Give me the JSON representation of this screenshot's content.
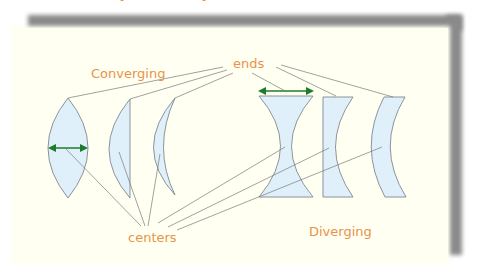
{
  "diagram": {
    "title_partial": "Converging and Diverging Lenses",
    "labels": {
      "converging": "Converging",
      "diverging": "Diverging",
      "ends": "ends",
      "centers": "centers"
    },
    "colors": {
      "label": "#e8934a",
      "lens_fill": "#dff0fa",
      "lens_stroke": "#808890",
      "arrow": "#1e7a2e",
      "panel": "#fffff2",
      "shadow": "#8a8a8a"
    },
    "lenses": [
      {
        "name": "biconvex",
        "group": "converging"
      },
      {
        "name": "plano-convex",
        "group": "converging"
      },
      {
        "name": "positive-meniscus",
        "group": "converging"
      },
      {
        "name": "biconcave",
        "group": "diverging"
      },
      {
        "name": "plano-concave",
        "group": "diverging"
      },
      {
        "name": "negative-meniscus",
        "group": "diverging"
      }
    ]
  }
}
